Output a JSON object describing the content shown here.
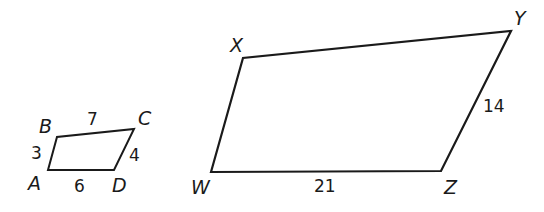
{
  "diagram": {
    "type": "similar-quadrilaterals",
    "stroke_color": "#1a1a1a",
    "small": {
      "name": "ABCD",
      "vertices": {
        "A": {
          "label": "A",
          "x": 48,
          "y": 170
        },
        "B": {
          "label": "B",
          "x": 57,
          "y": 137
        },
        "C": {
          "label": "C",
          "x": 134,
          "y": 129
        },
        "D": {
          "label": "D",
          "x": 114,
          "y": 170
        }
      },
      "sides": {
        "AB": "3",
        "BC": "7",
        "CD": "4",
        "AD": "6"
      }
    },
    "large": {
      "name": "WXYZ",
      "vertices": {
        "W": {
          "label": "W",
          "x": 211,
          "y": 172
        },
        "X": {
          "label": "X",
          "x": 243,
          "y": 58
        },
        "Y": {
          "label": "Y",
          "x": 511,
          "y": 31
        },
        "Z": {
          "label": "Z",
          "x": 441,
          "y": 171
        }
      },
      "sides": {
        "WZ": "21",
        "YZ": "14"
      }
    }
  }
}
